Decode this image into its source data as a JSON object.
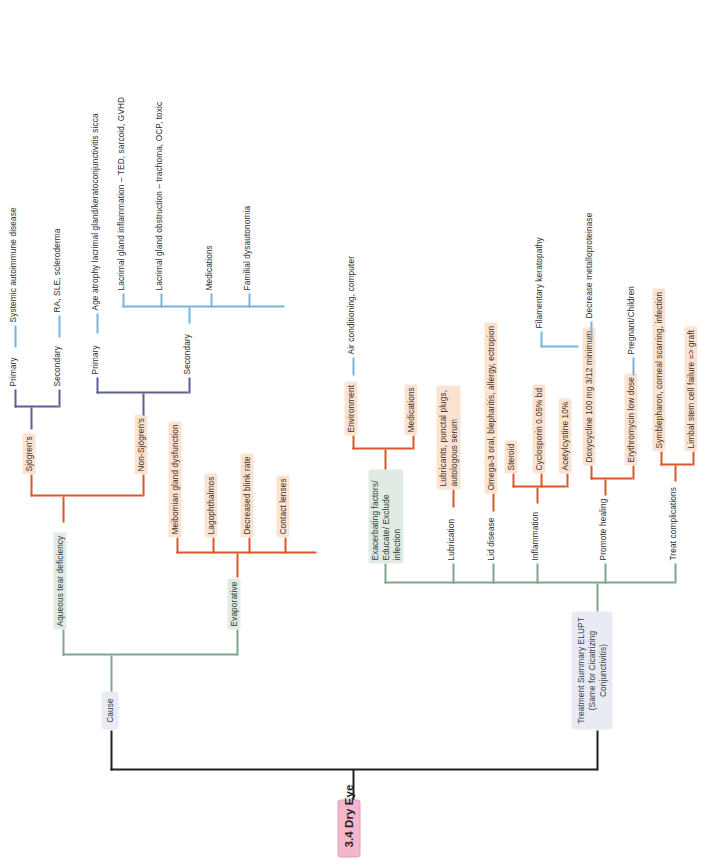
{
  "diagram": {
    "type": "mindmap",
    "orientation": "rotated-90-ccw",
    "root": {
      "label": "3.4 Dry Eye",
      "color": "#f3b7cb"
    },
    "branches": [
      {
        "label": "Cause",
        "color": "#e8eaf4",
        "children": [
          {
            "label": "Aqueous tear deficiency",
            "color": "#e0ebe3",
            "children": [
              {
                "label": "Sjögren's",
                "color": "#fae3d1",
                "children": [
                  {
                    "label": "Primary",
                    "color": "#ffffff",
                    "children": [
                      {
                        "label": "Systemic autoimmune disease",
                        "color": "#ffffff"
                      }
                    ]
                  },
                  {
                    "label": "Secondary",
                    "color": "#ffffff",
                    "children": [
                      {
                        "label": "RA, SLE, scleroderma",
                        "color": "#ffffff"
                      }
                    ]
                  }
                ]
              },
              {
                "label": "Non-Sjögren's",
                "color": "#fae3d1",
                "children": [
                  {
                    "label": "Primary",
                    "color": "#ffffff",
                    "children": [
                      {
                        "label": "Age atrophy lacrimal gland/keratoconjunctivitis sicca",
                        "color": "#ffffff"
                      }
                    ]
                  },
                  {
                    "label": "Secondary",
                    "color": "#ffffff",
                    "children": [
                      {
                        "label": "Lacrimal gland inflammation – TED, sarcoid, GVHD",
                        "color": "#ffffff"
                      },
                      {
                        "label": "Lacrimal gland obstruction – trachoma, OCP, toxic",
                        "color": "#ffffff"
                      },
                      {
                        "label": "Medications",
                        "color": "#ffffff"
                      },
                      {
                        "label": "Familial dysautonomia",
                        "color": "#ffffff"
                      }
                    ]
                  }
                ]
              }
            ]
          },
          {
            "label": "Evaporative",
            "color": "#e0ebe3",
            "children": [
              {
                "label": "Meibomian gland dysfunction",
                "color": "#fae3d1"
              },
              {
                "label": "Lagophthalmos",
                "color": "#fae3d1"
              },
              {
                "label": "Decreased blink rate",
                "color": "#fae3d1"
              },
              {
                "label": "Contact lenses",
                "color": "#fae3d1"
              }
            ]
          }
        ]
      },
      {
        "label": "Treatment Summary ELUPT (Same for Cicatrizing Conjunctivitis)",
        "color": "#e8eaf4",
        "children": [
          {
            "label": "Exacerbating factors/ Educate/ Exclude infection",
            "color": "#d7e6e2",
            "children": [
              {
                "label": "Environment",
                "color": "#fae3d1",
                "children": [
                  {
                    "label": "Air conditioning, computer",
                    "color": "#ffffff"
                  }
                ]
              },
              {
                "label": "Medications",
                "color": "#fae3d1"
              }
            ]
          },
          {
            "label": "Lubrication",
            "color": "#ffffff",
            "children": [
              {
                "label": "Lubricants, punctal plugs, autologous serum",
                "color": "#fae3d1"
              }
            ]
          },
          {
            "label": "Lid disease",
            "color": "#ffffff",
            "children": [
              {
                "label": "Omega-3 oral, blepharitis, allergy, ectropion",
                "color": "#fae3d1"
              }
            ]
          },
          {
            "label": "Inflammation",
            "color": "#ffffff",
            "children": [
              {
                "label": "Steroid",
                "color": "#fae3d1"
              },
              {
                "label": "Cyclosporin 0.05% bd",
                "color": "#fae3d1"
              },
              {
                "label": "Acetylcystine 10%",
                "color": "#fae3d1"
              }
            ]
          },
          {
            "label": "Promote healing",
            "color": "#ffffff",
            "children": [
              {
                "label": "Doxycycline 100 mg 3/12 minimum",
                "color": "#fae3d1",
                "children": [
                  {
                    "label": "Decrease metalloproteinase",
                    "color": "#ffffff"
                  }
                ]
              },
              {
                "label": "Erythromycin low dose",
                "color": "#fae3d1",
                "children": [
                  {
                    "label": "Pregnant/Children",
                    "color": "#ffffff"
                  }
                ]
              }
            ]
          },
          {
            "label": "Treat complications",
            "color": "#ffffff",
            "children": [
              {
                "label": "Symblepharon, corneal scarring, infection",
                "color": "#fae3d1"
              },
              {
                "label": "Limbal stem cell failure => graft",
                "color": "#fae3d1"
              },
              {
                "label": "Filamentary keratopathy",
                "color": "#ffffff"
              }
            ]
          }
        ]
      }
    ]
  },
  "nodes": {
    "root": "3.4 Dry Eye",
    "cause": "Cause",
    "treatment_summary": "Treatment Summary ELUPT (Same for Cicatrizing Conjunctivitis)",
    "aqueous": "Aqueous tear deficiency",
    "evaporative": "Evaporative",
    "sjogrens": "Sjögren's",
    "nonsjogrens": "Non-Sjögren's",
    "sj_primary": "Primary",
    "sj_secondary": "Secondary",
    "sj_primary_child": "Systemic autoimmune disease",
    "sj_secondary_child": "RA, SLE, scleroderma",
    "ns_primary": "Primary",
    "ns_secondary": "Secondary",
    "ns_primary_child": "Age atrophy lacrimal gland/keratoconjunctivitis sicca",
    "ns_sec_1": "Lacrimal gland inflammation – TED, sarcoid, GVHD",
    "ns_sec_2": "Lacrimal gland obstruction – trachoma, OCP, toxic",
    "ns_sec_3": "Medications",
    "ns_sec_4": "Familial dysautonomia",
    "evap_1": "Meibomian gland dysfunction",
    "evap_2": "Lagophthalmos",
    "evap_3": "Decreased blink rate",
    "evap_4": "Contact lenses",
    "tx_e": "Exacerbating factors/\nEducate/\nExclude infection",
    "tx_e_1": "Environment",
    "tx_e_1a": "Air conditioning, computer",
    "tx_e_2": "Medications",
    "tx_l": "Lubrication",
    "tx_l_1": "Lubricants, punctal plugs, autologous serum",
    "tx_lid": "Lid disease",
    "tx_lid_1": "Omega-3 oral, blepharitis, allergy, ectropion",
    "tx_i": "Inflammation",
    "tx_i_1": "Steroid",
    "tx_i_2": "Cyclosporin 0.05% bd",
    "tx_i_3": "Acetylcystine 10%",
    "tx_p": "Promote healing",
    "tx_p_1": "Doxycycline 100 mg 3/12 minimum",
    "tx_p_1a": "Decrease metalloproteinase",
    "tx_p_2": "Erythromycin low dose",
    "tx_p_2a": "Pregnant/Children",
    "tx_t": "Treat complications",
    "tx_t_0": "Filamentary keratopathy",
    "tx_t_1": "Symblepharon, corneal scarring, infection",
    "tx_t_2": "Limbal stem cell failure => graft"
  },
  "colors": {
    "root": "#f3b7cb",
    "lavender": "#e8eaf4",
    "green": "#e0ebe3",
    "peach": "#fae3d1",
    "teal": "#d7e6e2",
    "line_black": "#231f20",
    "line_green": "#7fa58c",
    "line_orange": "#d9572a",
    "line_blue": "#77b4dc",
    "line_navy": "#5b5f96"
  }
}
